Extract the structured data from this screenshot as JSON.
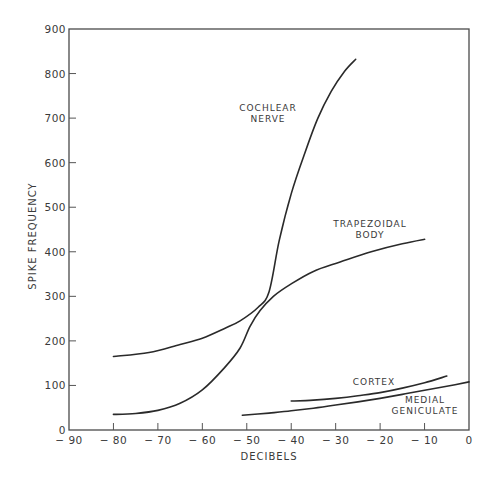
{
  "chart_data": {
    "type": "line",
    "title": "",
    "xlabel": "DECIBELS",
    "ylabel": "SPIKE FREQUENCY",
    "xlim": [
      -90,
      0
    ],
    "ylim": [
      0,
      900
    ],
    "xticks": [
      -90,
      -80,
      -70,
      -60,
      -50,
      -40,
      -30,
      -20,
      -10,
      0
    ],
    "xtick_labels": [
      "-90",
      "-80",
      "-70",
      "-60",
      "-50",
      "-40",
      "-30",
      "-20",
      "-10",
      "0"
    ],
    "yticks": [
      0,
      100,
      200,
      300,
      400,
      500,
      600,
      700,
      800,
      900
    ],
    "ytick_labels": [
      "0",
      "100",
      "200",
      "300",
      "400",
      "500",
      "600",
      "700",
      "800",
      "900"
    ],
    "grid": false,
    "legend": "none (curves labeled directly)",
    "series": [
      {
        "name": "COCHLEAR NERVE",
        "label_lines": [
          "COCHLEAR",
          "NERVE"
        ],
        "x": [
          -80,
          -72,
          -65,
          -60,
          -55,
          -51.5,
          -47.5,
          -45,
          -42.7,
          -40,
          -37,
          -34,
          -31,
          -28,
          -25.5
        ],
        "y": [
          165,
          174,
          192,
          206,
          228,
          245,
          275,
          310,
          425,
          530,
          620,
          700,
          760,
          805,
          832
        ]
      },
      {
        "name": "TRAPEZOIDAL BODY",
        "label_lines": [
          "TRAPEZOIDAL",
          "BODY"
        ],
        "x": [
          -80,
          -75,
          -70,
          -65,
          -60,
          -55,
          -51.5,
          -49.3,
          -47,
          -44,
          -40,
          -35,
          -29,
          -22,
          -15,
          -10
        ],
        "y": [
          35,
          37,
          44,
          60,
          90,
          140,
          184,
          232,
          268,
          300,
          328,
          356,
          377,
          400,
          418,
          428
        ]
      },
      {
        "name": "CORTEX",
        "label_lines": [
          "CORTEX"
        ],
        "x": [
          -40,
          -35,
          -30,
          -25,
          -20,
          -15,
          -10,
          -5
        ],
        "y": [
          65,
          67,
          71,
          77,
          84,
          94,
          106,
          121
        ]
      },
      {
        "name": "MEDIAL GENICULATE",
        "label_lines": [
          "MEDIAL",
          "GENICULATE"
        ],
        "x": [
          -51,
          -45,
          -40,
          -35,
          -30,
          -25,
          -20,
          -15,
          -10,
          -5,
          0
        ],
        "y": [
          33,
          38,
          43,
          49,
          56,
          63,
          71,
          80,
          89,
          98,
          108
        ]
      }
    ]
  }
}
